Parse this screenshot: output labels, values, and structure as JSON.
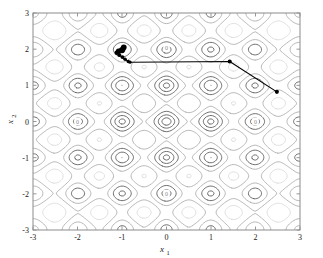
{
  "figure": {
    "background_color": "#ffffff",
    "axes_border_color": "#8c8c8c",
    "plot_box": {
      "left": 33,
      "top": 13,
      "right": 300,
      "bottom": 230
    }
  },
  "chart_data": {
    "type": "line",
    "plot_kind": "contour-with-trajectory",
    "title": "",
    "subtitle": "",
    "xlabel": "x",
    "xlabel_sub": "1",
    "ylabel": "x",
    "ylabel_sub": "2",
    "xlim": [
      -3,
      3
    ],
    "ylim": [
      -3,
      3
    ],
    "xticks": [
      -3,
      -2,
      -1,
      0,
      1,
      2,
      3
    ],
    "yticks": [
      -3,
      -2,
      -1,
      0,
      1,
      2,
      3
    ],
    "xticklabels": [
      "-3",
      "-2",
      "-1",
      "0",
      "1",
      "2",
      "3"
    ],
    "yticklabels": [
      "-3",
      "-2",
      "-1",
      "0",
      "1",
      "2",
      "3"
    ],
    "grid": false,
    "legend": null,
    "legend_position": "none",
    "background_function": "Rastrigin-like multimodal objective: f(x1,x2) = 20 + x1^2 + x2^2 - 10*cos(2*pi*x1) - 10*cos(2*pi*x2)",
    "contour_levels": [
      2,
      6,
      12,
      20,
      30,
      42,
      56,
      72
    ],
    "contour_colors": {
      "inner": "#4d4d4d",
      "mid": "#9a9a9a",
      "outer": "#d2d2d2"
    },
    "contour_labels": [
      {
        "text": "0",
        "x": 0.0,
        "y": 2.05
      },
      {
        "text": "0",
        "x": 0.0,
        "y": -2.0
      },
      {
        "text": "0",
        "x": -2.0,
        "y": 0.0
      },
      {
        "text": "0",
        "x": 2.0,
        "y": 0.0
      }
    ],
    "series": [
      {
        "name": "optimization trajectory",
        "type": "line",
        "color": "#000000",
        "linewidth": 1.1,
        "marker": "filled-circle",
        "marker_color": "#000000",
        "x": [
          2.48,
          1.42,
          -0.82,
          -0.86,
          -0.93,
          -0.99,
          -1.06,
          -1.12,
          -1.08,
          -1.0,
          -0.96
        ],
        "y": [
          0.82,
          1.66,
          1.64,
          1.66,
          1.72,
          1.78,
          1.84,
          1.9,
          1.95,
          1.97,
          2.05
        ],
        "marker_sizes": [
          3.2,
          3.2,
          2.6,
          2.6,
          2.8,
          3.0,
          3.2,
          3.4,
          4.0,
          4.6,
          4.4
        ],
        "start_point": {
          "x": 2.48,
          "y": 0.82
        },
        "end_point": {
          "x": -0.96,
          "y": 2.05
        },
        "n_points": 11
      }
    ]
  }
}
